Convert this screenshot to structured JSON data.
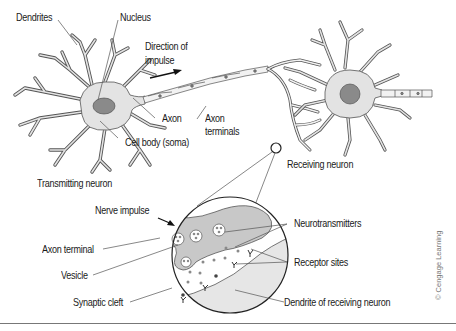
{
  "diagram": {
    "colors": {
      "cell_fill": "#e3e3e3",
      "outline": "#555555",
      "nucleus_fill": "#8a8a8a",
      "terminal_fill": "#c8c8c8",
      "dendrite_fill": "#e6e6e6",
      "text": "#1a1a1a",
      "neurotransmitter": "#8a8a8a"
    },
    "labels": {
      "dendrites": "Dendrites",
      "nucleus": "Nucleus",
      "direction_line1": "Direction of",
      "direction_line2": "impulse",
      "axon": "Axon",
      "axon_terminals_line1": "Axon",
      "axon_terminals_line2": "terminals",
      "cell_body": "Cell body (soma)",
      "transmitting_neuron": "Transmitting neuron",
      "receiving_neuron": "Receiving neuron",
      "nerve_impulse": "Nerve impulse",
      "axon_terminal": "Axon terminal",
      "vesicle": "Vesicle",
      "synaptic_cleft": "Synaptic cleft",
      "neurotransmitters": "Neurotransmitters",
      "receptor_sites": "Receptor sites",
      "dendrite_receiving": "Dendrite of receiving neuron"
    },
    "credit": "© Cengage Learning",
    "nodes": [
      {
        "id": "transmitting-neuron",
        "label": "Transmitting neuron"
      },
      {
        "id": "receiving-neuron",
        "label": "Receiving neuron"
      },
      {
        "id": "synapse-inset",
        "label": "Synapse (magnified)"
      }
    ],
    "edges": [
      {
        "from": "transmitting-neuron",
        "to": "receiving-neuron",
        "label": "Direction of impulse"
      },
      {
        "from": "receiving-neuron",
        "to": "synapse-inset",
        "label": "magnified view"
      }
    ]
  }
}
